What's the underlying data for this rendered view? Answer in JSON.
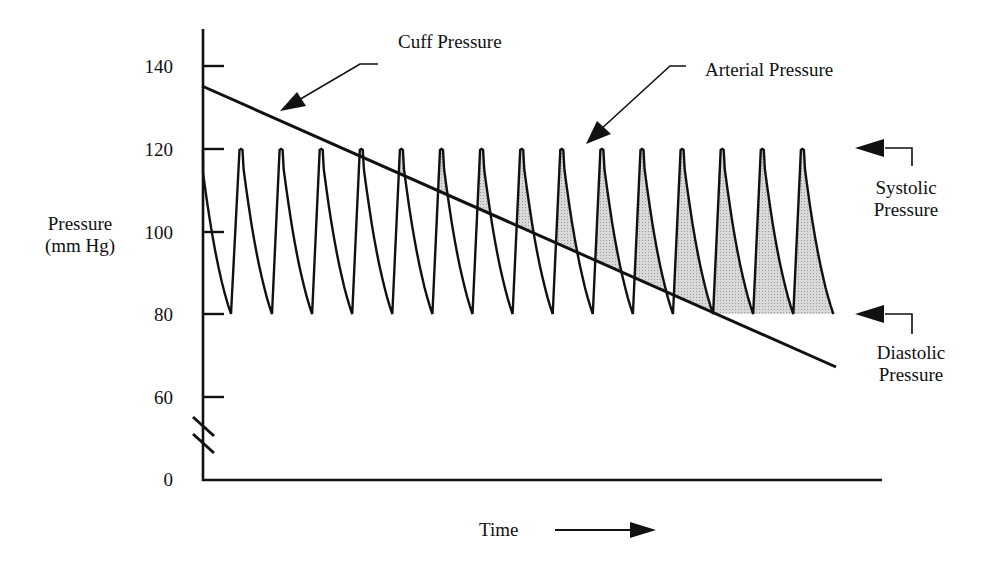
{
  "chart_data": {
    "type": "line",
    "title": "",
    "xlabel": "Time",
    "ylabel": "Pressure (mm Hg)",
    "ylabel_lines": [
      "Pressure",
      "(mm Hg)"
    ],
    "y_ticks": [
      140,
      120,
      100,
      80,
      60,
      0
    ],
    "y_tick_labels": [
      "140",
      "120",
      "100",
      "80",
      "60",
      "0"
    ],
    "axis_break": "between 60 and 0 on y-axis",
    "ylim": [
      0,
      145
    ],
    "grid": false,
    "series": [
      {
        "name": "Cuff Pressure",
        "kind": "linear decreasing",
        "start_value": 135,
        "end_value": 67
      },
      {
        "name": "Arterial Pressure",
        "kind": "periodic pulse waveform",
        "systolic": 120,
        "diastolic": 80,
        "pulse_count": 15
      }
    ],
    "annotations": [
      {
        "text": "Cuff Pressure",
        "points_to": "cuff pressure line"
      },
      {
        "text": "Arterial Pressure",
        "points_to": "arterial pulse waveform"
      },
      {
        "text": "Systolic Pressure",
        "points_to": 120
      },
      {
        "text": "Diastolic Pressure",
        "points_to": 80
      }
    ],
    "shaded_region": "area of arterial waveform above cuff pressure line (blood flow through cuff)"
  },
  "labels": {
    "cuff": "Cuff Pressure",
    "arterial": "Arterial Pressure",
    "systolic_line1": "Systolic",
    "systolic_line2": "Pressure",
    "diastolic_line1": "Diastolic",
    "diastolic_line2": "Pressure",
    "ylabel_line1": "Pressure",
    "ylabel_line2": "(mm Hg)",
    "xlabel": "Time"
  },
  "ticks": {
    "t140": "140",
    "t120": "120",
    "t100": "100",
    "t80": "80",
    "t60": "60",
    "t0": "0"
  },
  "colors": {
    "ink": "#111111",
    "shade": "#c8c8c8"
  }
}
